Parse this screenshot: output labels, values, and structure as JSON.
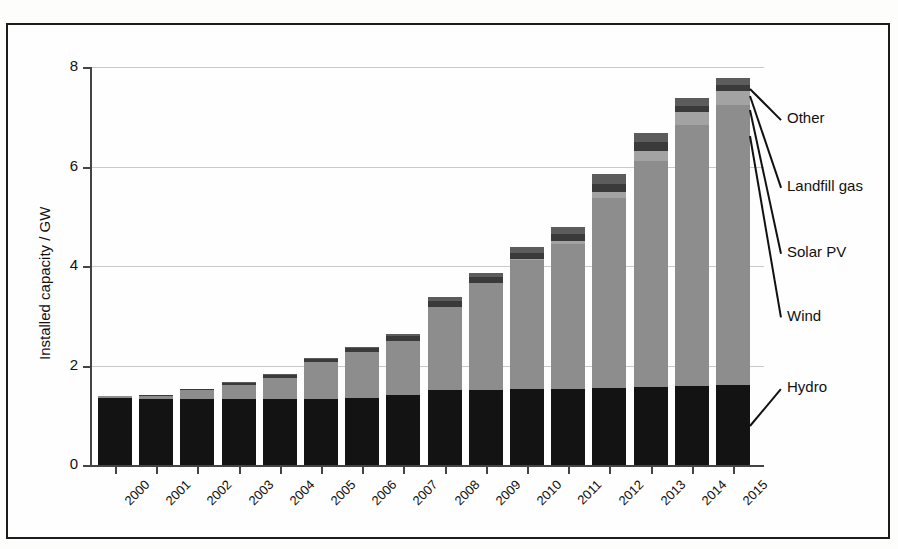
{
  "chart_data": {
    "type": "bar",
    "stacked": true,
    "title": "",
    "xlabel": "",
    "ylabel": "Installed capacity / GW",
    "ylim": [
      0,
      8
    ],
    "yticks": [
      0,
      2,
      4,
      6,
      8
    ],
    "grid": true,
    "legend_position": "right-callouts",
    "categories": [
      "2000",
      "2001",
      "2002",
      "2003",
      "2004",
      "2005",
      "2006",
      "2007",
      "2008",
      "2009",
      "2010",
      "2011",
      "2012",
      "2013",
      "2014",
      "2015"
    ],
    "series": [
      {
        "name": "Hydro",
        "color": "#131313",
        "values": [
          1.34,
          1.33,
          1.33,
          1.32,
          1.32,
          1.33,
          1.35,
          1.4,
          1.5,
          1.51,
          1.52,
          1.53,
          1.55,
          1.57,
          1.58,
          1.61
        ]
      },
      {
        "name": "Wind",
        "color": "#8d8d8d",
        "values": [
          0.04,
          0.06,
          0.17,
          0.28,
          0.42,
          0.74,
          0.92,
          1.1,
          1.68,
          2.15,
          2.6,
          2.92,
          3.82,
          4.55,
          5.25,
          5.62
        ]
      },
      {
        "name": "Solar PV",
        "color": "#a3a3a3",
        "values": [
          0.0,
          0.0,
          0.0,
          0.0,
          0.0,
          0.0,
          0.0,
          0.0,
          0.0,
          0.0,
          0.02,
          0.05,
          0.12,
          0.2,
          0.26,
          0.28
        ]
      },
      {
        "name": "Landfill gas",
        "color": "#3a3a3a",
        "values": [
          0.0,
          0.01,
          0.03,
          0.05,
          0.06,
          0.07,
          0.08,
          0.1,
          0.12,
          0.12,
          0.13,
          0.14,
          0.16,
          0.17,
          0.13,
          0.13
        ]
      },
      {
        "name": "Other",
        "color": "#5c5c5c",
        "values": [
          0.0,
          0.0,
          0.0,
          0.02,
          0.02,
          0.02,
          0.03,
          0.04,
          0.08,
          0.08,
          0.11,
          0.14,
          0.19,
          0.18,
          0.15,
          0.14
        ]
      }
    ],
    "callouts": [
      {
        "label": "Other",
        "x": 787,
        "y": 119
      },
      {
        "label": "Landfill gas",
        "x": 787,
        "y": 187
      },
      {
        "label": "Solar PV",
        "x": 787,
        "y": 253
      },
      {
        "label": "Wind",
        "x": 787,
        "y": 317
      },
      {
        "label": "Hydro",
        "x": 787,
        "y": 388
      }
    ]
  },
  "style": {
    "frame_color": "#1c1c1c",
    "grid_color": "#c9c9c9",
    "axis_color": "#444444",
    "background": "#fefefe"
  }
}
